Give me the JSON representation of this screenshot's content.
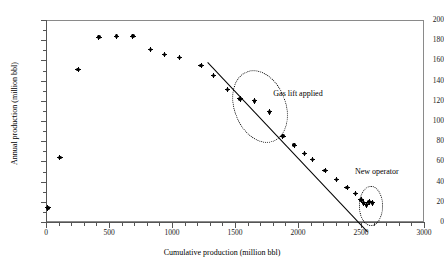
{
  "chart_data": {
    "type": "scatter",
    "title": "",
    "xlabel": "Cumulative production (million bbl)",
    "ylabel": "Annual production (million bbl)",
    "xlim": [
      0,
      3000
    ],
    "ylim": [
      0,
      200
    ],
    "xticks": [
      0,
      500,
      1000,
      1500,
      2000,
      2500,
      3000
    ],
    "yticks": [
      0,
      20,
      40,
      60,
      80,
      100,
      120,
      140,
      160,
      180,
      200
    ],
    "grid": false,
    "legend": null,
    "series": [
      {
        "name": "Annual production",
        "marker": "filled-diamond-cross",
        "color": "#000000",
        "points": [
          [
            15,
            14
          ],
          [
            110,
            64
          ],
          [
            255,
            151
          ],
          [
            420,
            183
          ],
          [
            560,
            184
          ],
          [
            690,
            184
          ],
          [
            830,
            171
          ],
          [
            940,
            166
          ],
          [
            1060,
            163
          ],
          [
            1230,
            155
          ],
          [
            1330,
            145
          ],
          [
            1440,
            131
          ],
          [
            1540,
            122
          ],
          [
            1655,
            120
          ],
          [
            1775,
            109
          ],
          [
            1880,
            85
          ],
          [
            1970,
            76
          ],
          [
            2050,
            68
          ],
          [
            2115,
            62
          ],
          [
            2215,
            51
          ],
          [
            2305,
            42
          ],
          [
            2390,
            34
          ],
          [
            2455,
            28
          ],
          [
            2500,
            22
          ],
          [
            2520,
            19
          ],
          [
            2545,
            17
          ],
          [
            2565,
            20
          ],
          [
            2590,
            19
          ]
        ]
      }
    ],
    "trendline": {
      "type": "linear",
      "x_start": 1285,
      "y_start": 158,
      "x_end": 2555,
      "y_end": -10,
      "style": "solid",
      "color": "#000000"
    },
    "annotations": [
      {
        "name": "gas-lift-applied",
        "text": "Gas lift applied",
        "text_x": 2000,
        "text_y": 127,
        "shape": "ellipse-dotted",
        "shape_cx": 1690,
        "shape_cy": 116,
        "shape_rx": 200,
        "shape_ry": 36,
        "shape_rotation_deg": -21
      },
      {
        "name": "new-operator",
        "text": "New operator",
        "text_x": 2625,
        "text_y": 50,
        "shape": "ellipse-dotted",
        "shape_cx": 2570,
        "shape_cy": 17,
        "shape_rx": 90,
        "shape_ry": 19,
        "shape_rotation_deg": 0
      }
    ]
  }
}
